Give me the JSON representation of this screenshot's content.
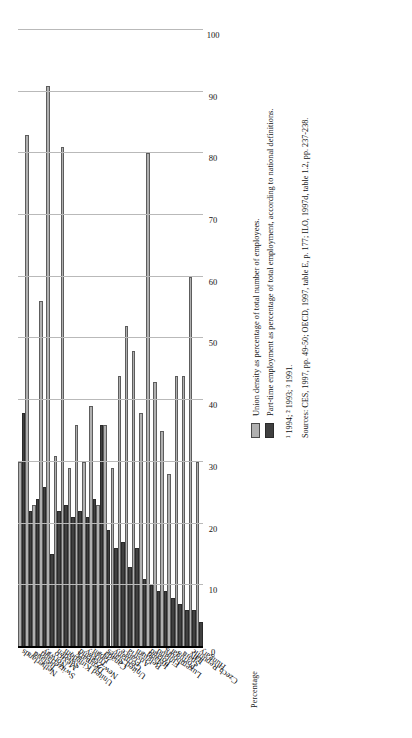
{
  "chart_data": {
    "type": "bar",
    "orientation": "horizontal",
    "title": "",
    "xlabel": "",
    "ylabel": "Percentage",
    "axis_title": "Percentage",
    "xlim": [
      0,
      100
    ],
    "tick_step": 10,
    "tick_labels": [
      "0",
      "10",
      "20",
      "30",
      "40",
      "50",
      "60",
      "70",
      "80",
      "90",
      "100"
    ],
    "grid": true,
    "axis_reversed": true,
    "legend_position": "below-right",
    "categories": [
      "Netherlands",
      "Iceland",
      "Switzerland",
      "Norway",
      "Mexico",
      "Sweden",
      "United Kingdom",
      "Denmark",
      "New Zealand",
      "Turkey",
      "Japan",
      "Canada",
      "United States",
      "Germany",
      "France",
      "Austria",
      "Belgium",
      "Ireland",
      "Poland",
      "Finland",
      "Luxembourg",
      "Portugal",
      "Spain",
      "Italy",
      "Czech Republic",
      "Hungary"
    ],
    "category_footnotes": [
      "",
      "1",
      "1",
      "",
      "3",
      "",
      "",
      "1",
      "",
      "",
      "",
      "2",
      "",
      "",
      "",
      "",
      "",
      "2",
      "",
      "",
      "",
      "",
      "1",
      "1",
      "",
      ""
    ],
    "series": [
      {
        "name": "Union density as percentage of total number of employees.",
        "key": "union_density",
        "color": "#b0b0b0",
        "values": [
          30,
          83,
          23,
          56,
          91,
          31,
          81,
          29,
          36,
          30,
          39,
          23,
          36,
          29,
          44,
          52,
          48,
          38,
          80,
          43,
          35,
          28,
          44,
          44,
          60,
          30
        ]
      },
      {
        "name": "Part-time employment as percentage of total employment, according to national definitions.",
        "key": "part_time",
        "color": "#404040",
        "values": [
          38,
          22,
          24,
          26,
          15,
          22,
          23,
          21,
          22,
          21,
          24,
          36,
          19,
          16,
          17,
          13,
          16,
          11,
          10,
          9,
          9,
          8,
          7,
          6,
          6,
          4
        ]
      }
    ]
  },
  "legend": {
    "items": [
      {
        "swatch": "light",
        "label": "Union density as percentage of total number of employees."
      },
      {
        "swatch": "dark",
        "label": "Part-time employment as percentage of total employment, according to national definitions."
      }
    ]
  },
  "notes": {
    "footnote_line": "¹ 1994;  ² 1993;  ³ 1991.",
    "sources": "Sources: CES, 1997, pp. 49-50; OECD, 1997, table E, p. 177; ILO, 1997d, table 1.2, pp. 237-238."
  }
}
